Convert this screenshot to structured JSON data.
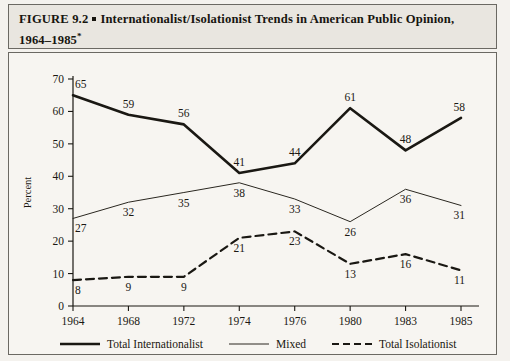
{
  "figure": {
    "label": "FIGURE 9.2",
    "bullet": "square-bullet",
    "title_line1": "Internationalist/Isolationist Trends in American Public Opinion,",
    "title_line2": "1964–1985",
    "footnote_marker": "*"
  },
  "chart_data": {
    "type": "line",
    "title": "Internationalist/Isolationist Trends in American Public Opinion, 1964–1985",
    "xlabel": "",
    "ylabel": "Percent",
    "categories": [
      "1964",
      "1968",
      "1972",
      "1974",
      "1976",
      "1980",
      "1983",
      "1985"
    ],
    "ylim": [
      0,
      70
    ],
    "yticks": [
      0,
      10,
      20,
      30,
      40,
      50,
      60,
      70
    ],
    "grid": false,
    "legend_position": "bottom",
    "series": [
      {
        "name": "Total Internationalist",
        "style": "solid-thick",
        "color": "#1a1813",
        "values": [
          65,
          59,
          56,
          41,
          44,
          61,
          48,
          58
        ],
        "label_side": "above"
      },
      {
        "name": "Mixed",
        "style": "solid-thin",
        "color": "#2a2720",
        "values": [
          27,
          32,
          35,
          38,
          33,
          26,
          36,
          31
        ],
        "label_side": "below"
      },
      {
        "name": "Total Isolationist",
        "style": "dashed",
        "color": "#1a1813",
        "values": [
          8,
          9,
          9,
          21,
          23,
          13,
          16,
          11
        ],
        "label_side": "below"
      }
    ]
  },
  "legend": {
    "items": [
      {
        "label": "Total Internationalist",
        "swatch": "thick-solid-line-swatch"
      },
      {
        "label": "Mixed",
        "swatch": "thin-solid-line-swatch"
      },
      {
        "label": "Total Isolationist",
        "swatch": "dashed-line-swatch"
      }
    ]
  },
  "colors": {
    "ink": "#1a1813",
    "paper": "#f7f5f1",
    "title_bg": "#e9e6e0",
    "border": "#6b6963"
  }
}
